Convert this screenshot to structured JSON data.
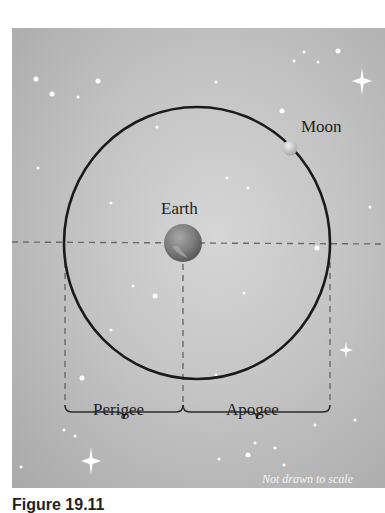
{
  "diagram": {
    "labels": {
      "moon": "Moon",
      "earth": "Earth",
      "perigee": "Perigee",
      "apogee": "Apogee",
      "scale_note": "Not drawn to scale"
    },
    "caption": "Figure 19.11",
    "colors": {
      "background": "#c4c4c4",
      "orbit": "#1a1a1a",
      "dash": "#6a6a6a",
      "earth": "#7d7d7d",
      "moon": "#d9d9d9",
      "star": "#ffffff",
      "text": "#1e1e1e"
    },
    "geometry": {
      "orbit_center": [
        197,
        243
      ],
      "orbit_rx": 133,
      "orbit_ry": 136,
      "earth_center": [
        183,
        243
      ],
      "earth_radius": 19,
      "moon_center": [
        290,
        148
      ],
      "moon_radius": 7
    }
  }
}
